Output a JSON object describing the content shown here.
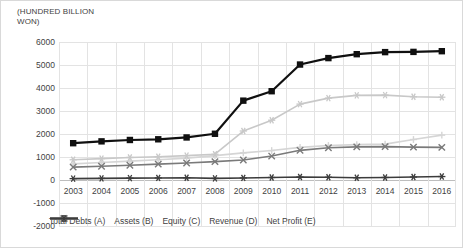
{
  "axis_title": "(HUNDRED BILLION WON)",
  "chart_data": {
    "type": "line",
    "title": "",
    "xlabel": "",
    "ylabel": "(HUNDRED BILLION WON)",
    "ylim": [
      -2000,
      6000
    ],
    "ytick_step": 1000,
    "yticks": [
      "6000",
      "5000",
      "4000",
      "3000",
      "2000",
      "1000",
      "0",
      "-1000",
      "-2000"
    ],
    "grid": true,
    "legend_position": "bottom-inside",
    "categories": [
      "2003",
      "2004",
      "2005",
      "2006",
      "2007",
      "2008",
      "2009",
      "2010",
      "2011",
      "2012",
      "2013",
      "2014",
      "2015",
      "2016"
    ],
    "series": [
      {
        "name": "Total Debts (A)",
        "color": "#d5d5d5",
        "marker": "plus",
        "values": [
          700,
          760,
          820,
          880,
          950,
          1060,
          1180,
          1280,
          1420,
          1500,
          1540,
          1560,
          1760,
          1950
        ]
      },
      {
        "name": "Assets (B)",
        "color": "#101010",
        "marker": "square",
        "values": [
          1600,
          1680,
          1740,
          1770,
          1850,
          2010,
          3450,
          3860,
          5020,
          5300,
          5470,
          5560,
          5570,
          5600
        ]
      },
      {
        "name": "Equity (C)",
        "color": "#c8c8c8",
        "marker": "star",
        "values": [
          880,
          930,
          980,
          1010,
          1060,
          1120,
          2130,
          2600,
          3300,
          3560,
          3680,
          3690,
          3620,
          3600
        ]
      },
      {
        "name": "Revenue (D)",
        "color": "#7a7a7a",
        "marker": "x",
        "values": [
          560,
          600,
          640,
          690,
          740,
          800,
          870,
          1040,
          1290,
          1400,
          1440,
          1450,
          1430,
          1420
        ]
      },
      {
        "name": "Net Profit (E)",
        "color": "#3c3c3c",
        "marker": "asterisk",
        "values": [
          60,
          70,
          80,
          90,
          100,
          70,
          90,
          110,
          130,
          120,
          100,
          110,
          130,
          150
        ]
      }
    ]
  }
}
